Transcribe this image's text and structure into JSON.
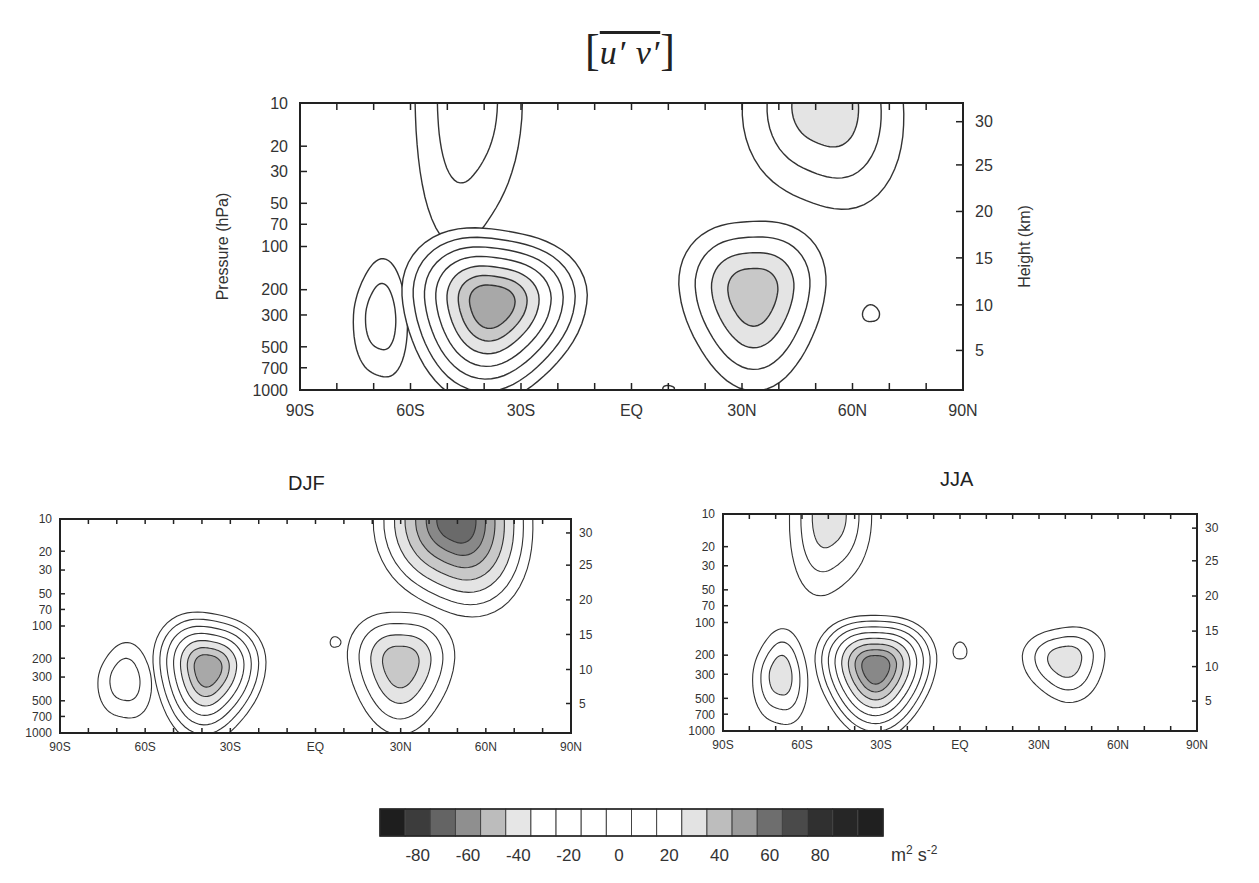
{
  "figure": {
    "title_symbol": "[u' v']",
    "title_parts": {
      "open": "[",
      "expr": "u′ v′",
      "close": "]"
    },
    "colorbar": {
      "tick_labels": [
        "-80",
        "-60",
        "-40",
        "-20",
        "0",
        "20",
        "40",
        "60",
        "80"
      ],
      "units": "m² s⁻²",
      "units_base": "m",
      "units_sup1": "2",
      "units_mid": " s",
      "units_sup2": "-2",
      "levels": [
        -95,
        -85,
        -75,
        -65,
        -55,
        -45,
        -35,
        -25,
        -15,
        -5,
        5,
        15,
        25,
        35,
        45,
        55,
        65,
        75,
        85,
        95
      ],
      "colors": [
        "#1e1e1e",
        "#3c3c3c",
        "#646464",
        "#8f8f8f",
        "#bcbcbc",
        "#e6e6e6",
        "#ffffff",
        "#ffffff",
        "#ffffff",
        "#ffffff",
        "#ffffff",
        "#ffffff",
        "#e3e3e3",
        "#bdbdbd",
        "#9a9a9a",
        "#6e6e6e",
        "#4a4a4a",
        "#303030",
        "#262626",
        "#202020"
      ]
    }
  },
  "chart_data": [
    {
      "type": "contour",
      "id": "annual",
      "title": "",
      "xlabel": "",
      "ylabel": "Pressure  (hPa)",
      "y2label": "Height (km)",
      "x_ticks": [
        "90S",
        "60S",
        "30S",
        "EQ",
        "30N",
        "60N",
        "90N"
      ],
      "x_tick_values": [
        -90,
        -60,
        -30,
        0,
        30,
        60,
        90
      ],
      "xlim": [
        -90,
        90
      ],
      "y_ticks": [
        "10",
        "20",
        "30",
        "50",
        "70",
        "100",
        "200",
        "300",
        "500",
        "700",
        "1000"
      ],
      "y_tick_values": [
        10,
        20,
        30,
        50,
        70,
        100,
        200,
        300,
        500,
        700,
        1000
      ],
      "ylim": [
        1000,
        10
      ],
      "y2_ticks": [
        "30",
        "25",
        "20",
        "15",
        "10",
        "5"
      ],
      "y2_tick_pressures": [
        13.5,
        27,
        57,
        120,
        255,
        530
      ],
      "features": [
        {
          "name": "SH-polar-stratosphere",
          "lat": -45,
          "p": 10,
          "rx_deg": 14,
          "ry_dec": 0.9,
          "n": 2,
          "shade_from": 99,
          "open_top": true
        },
        {
          "name": "NH-polar-stratosphere",
          "lat": 53,
          "p": 10,
          "rx_deg": 21,
          "ry_dec": 0.7,
          "n": 3,
          "shade_from": 3,
          "open_top": true
        },
        {
          "name": "SH-high-lat",
          "lat": -68,
          "p": 300,
          "rx_deg": 7,
          "ry_dec": 0.42,
          "n": 2,
          "shade_from": 3
        },
        {
          "name": "SH-jet",
          "lat": -38,
          "p": 250,
          "rx_deg": 24,
          "ry_dec": 0.62,
          "n": 7,
          "shade_from": 5
        },
        {
          "name": "NH-jet",
          "lat": 33,
          "p": 210,
          "rx_deg": 19,
          "ry_dec": 0.6,
          "n": 4,
          "shade_from": 3
        },
        {
          "name": "NH-small",
          "lat": 65,
          "p": 290,
          "rx_deg": 2.2,
          "ry_dec": 0.06,
          "n": 1,
          "shade_from": 99
        },
        {
          "name": "EQ-small",
          "lat": 10,
          "p": 970,
          "rx_deg": 1.5,
          "ry_dec": 0.02,
          "n": 1,
          "shade_from": 99
        }
      ]
    },
    {
      "type": "contour",
      "id": "DJF",
      "title": "DJF",
      "x_ticks": [
        "90S",
        "60S",
        "30S",
        "EQ",
        "30N",
        "60N",
        "90N"
      ],
      "x_tick_values": [
        -90,
        -60,
        -30,
        0,
        30,
        60,
        90
      ],
      "xlim": [
        -90,
        90
      ],
      "y_ticks": [
        "10",
        "20",
        "30",
        "50",
        "70",
        "100",
        "200",
        "300",
        "500",
        "700",
        "1000"
      ],
      "y_tick_values": [
        10,
        20,
        30,
        50,
        70,
        100,
        200,
        300,
        500,
        700,
        1000
      ],
      "ylim": [
        1000,
        10
      ],
      "y2_ticks": [
        "30",
        "25",
        "20",
        "15",
        "10",
        "5"
      ],
      "y2_tick_pressures": [
        13.5,
        27,
        57,
        120,
        255,
        530
      ],
      "features": [
        {
          "name": "NH-polar-stratosphere",
          "lat": 50,
          "p": 10,
          "rx_deg": 27,
          "ry_dec": 0.85,
          "n": 7,
          "shade_from": 3,
          "open_top": true
        },
        {
          "name": "SH-high-lat",
          "lat": -67,
          "p": 310,
          "rx_deg": 9,
          "ry_dec": 0.36,
          "n": 2,
          "shade_from": 99
        },
        {
          "name": "SH-jet",
          "lat": -38,
          "p": 250,
          "rx_deg": 19,
          "ry_dec": 0.62,
          "n": 7,
          "shade_from": 5
        },
        {
          "name": "EQ-small",
          "lat": 7,
          "p": 140,
          "rx_deg": 1.8,
          "ry_dec": 0.05,
          "n": 1,
          "shade_from": 99
        },
        {
          "name": "NH-jet",
          "lat": 30,
          "p": 225,
          "rx_deg": 18,
          "ry_dec": 0.58,
          "n": 4,
          "shade_from": 3
        }
      ]
    },
    {
      "type": "contour",
      "id": "JJA",
      "title": "JJA",
      "x_ticks": [
        "90S",
        "60S",
        "30S",
        "EQ",
        "30N",
        "60N",
        "90N"
      ],
      "x_tick_values": [
        -90,
        -60,
        -30,
        0,
        30,
        60,
        90
      ],
      "xlim": [
        -90,
        90
      ],
      "y_ticks": [
        "10",
        "20",
        "30",
        "50",
        "70",
        "100",
        "200",
        "300",
        "500",
        "700",
        "1000"
      ],
      "y_tick_values": [
        10,
        20,
        30,
        50,
        70,
        100,
        200,
        300,
        500,
        700,
        1000
      ],
      "ylim": [
        1000,
        10
      ],
      "y2_ticks": [
        "30",
        "25",
        "20",
        "15",
        "10",
        "5"
      ],
      "y2_tick_pressures": [
        13.5,
        27,
        57,
        120,
        255,
        530
      ],
      "features": [
        {
          "name": "SH-polar-stratosphere",
          "lat": -50,
          "p": 10,
          "rx_deg": 15,
          "ry_dec": 0.7,
          "n": 3,
          "shade_from": 3,
          "open_top": true
        },
        {
          "name": "SH-high-lat",
          "lat": -68,
          "p": 300,
          "rx_deg": 10,
          "ry_dec": 0.45,
          "n": 3,
          "shade_from": 3
        },
        {
          "name": "SH-jet",
          "lat": -32,
          "p": 260,
          "rx_deg": 22,
          "ry_dec": 0.58,
          "n": 8,
          "shade_from": 5
        },
        {
          "name": "EQ-small",
          "lat": 0,
          "p": 180,
          "rx_deg": 2.5,
          "ry_dec": 0.08,
          "n": 1,
          "shade_from": 99
        },
        {
          "name": "NH-jet",
          "lat": 40,
          "p": 220,
          "rx_deg": 15,
          "ry_dec": 0.35,
          "n": 3,
          "shade_from": 3
        }
      ]
    }
  ]
}
